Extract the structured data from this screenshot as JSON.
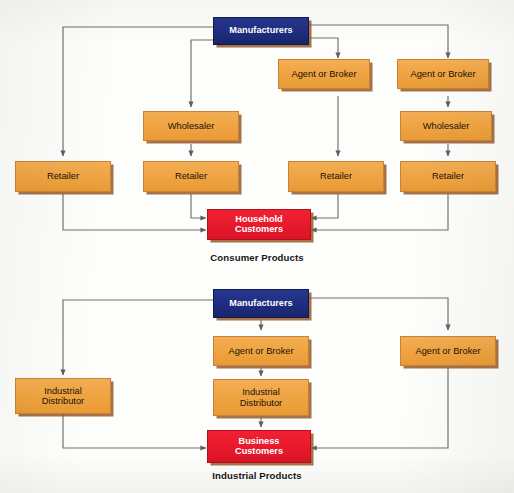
{
  "figure": {
    "title_top": "Consumer Products",
    "title_bottom": "Industrial Products",
    "colors": {
      "manufacturer": "#1e2c7e",
      "intermediary": "#efa340",
      "customer": "#e6192b",
      "line": "#6e6e6e",
      "text_dark": "#1a1208",
      "text_light": "#ffffff",
      "background": "#fdfdfb"
    }
  },
  "consumer": {
    "caption": "Consumer Products",
    "manufacturer": {
      "label": "Manufacturers"
    },
    "customer": {
      "label_line1": "Household",
      "label_line2": "Customers"
    },
    "channels": [
      {
        "name": "direct",
        "nodes": [
          "Retailer"
        ]
      },
      {
        "name": "wholesaler",
        "nodes": [
          "Wholesaler",
          "Retailer"
        ]
      },
      {
        "name": "agent",
        "nodes": [
          "Agent or Broker",
          "Retailer"
        ]
      },
      {
        "name": "agent-wholesaler",
        "nodes": [
          "Agent or Broker",
          "Wholesaler",
          "Retailer"
        ]
      }
    ],
    "boxes": {
      "manufacturers": "Manufacturers",
      "agent_broker_c3": "Agent or Broker",
      "agent_broker_c4": "Agent or Broker",
      "wholesaler_c2": "Wholesaler",
      "wholesaler_c4": "Wholesaler",
      "retailer_c1": "Retailer",
      "retailer_c2": "Retailer",
      "retailer_c3": "Retailer",
      "retailer_c4": "Retailer"
    }
  },
  "industrial": {
    "caption": "Industrial Products",
    "manufacturer": {
      "label": "Manufacturers"
    },
    "customer": {
      "label_line1": "Business",
      "label_line2": "Customers"
    },
    "channels": [
      {
        "name": "direct-distributor",
        "nodes": [
          "Industrial Distributor"
        ]
      },
      {
        "name": "agent-distributor",
        "nodes": [
          "Agent or Broker",
          "Industrial Distributor"
        ]
      },
      {
        "name": "agent-direct",
        "nodes": [
          "Agent or Broker"
        ]
      }
    ],
    "boxes": {
      "manufacturers": "Manufacturers",
      "industrial_distributor_left_l1": "Industrial",
      "industrial_distributor_left_l2": "Distributor",
      "agent_broker_center": "Agent or Broker",
      "industrial_distributor_center_l1": "Industrial",
      "industrial_distributor_center_l2": "Distributor",
      "agent_broker_right": "Agent or Broker"
    }
  }
}
